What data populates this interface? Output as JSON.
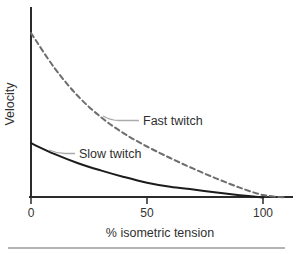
{
  "figure": {
    "background": "#ffffff",
    "axis_color": "#2b2b2b",
    "leader_line_color": "#ababab",
    "divider_color": "#9a9a9a",
    "text_color": "#2f2f2f"
  },
  "chart_data": {
    "type": "line",
    "title": "",
    "xlabel": "% isometric tension",
    "ylabel": "Velocity",
    "x_ticks": [
      0,
      50,
      100
    ],
    "xlim": [
      0,
      112
    ],
    "ylim": [
      0,
      1.05
    ],
    "grid": false,
    "legend_position": "inline-annotations",
    "series": [
      {
        "name": "Fast twitch",
        "style": "dashed",
        "color": "#6e6e6e",
        "x": [
          0,
          10,
          20,
          30,
          40,
          50,
          60,
          70,
          80,
          90,
          100,
          110
        ],
        "y": [
          1.0,
          0.79,
          0.62,
          0.49,
          0.39,
          0.31,
          0.24,
          0.175,
          0.115,
          0.06,
          0.015,
          0.0
        ]
      },
      {
        "name": "Slow twitch",
        "style": "solid",
        "color": "#1c1c1c",
        "x": [
          0,
          10,
          20,
          30,
          40,
          50,
          60,
          70,
          80,
          90,
          100
        ],
        "y": [
          0.33,
          0.265,
          0.21,
          0.165,
          0.125,
          0.09,
          0.065,
          0.048,
          0.03,
          0.014,
          0.0
        ]
      }
    ]
  }
}
